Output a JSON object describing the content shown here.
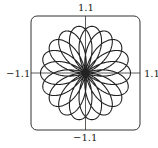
{
  "chart_data": {
    "type": "line",
    "title": "",
    "equation": "r = sin(9θ/4)",
    "theta_range": [
      0,
      25.1327
    ],
    "xlim": [
      -1.1,
      1.1
    ],
    "ylim": [
      -1.1,
      1.1
    ],
    "tick_labels": {
      "top": "1.1",
      "bottom": "−1.1",
      "left": "−1.1",
      "right": "1.1"
    },
    "grid": false,
    "frame": "rounded-rectangle",
    "color": "#222222"
  }
}
